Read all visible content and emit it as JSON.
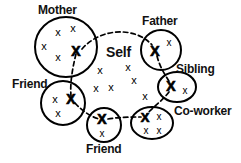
{
  "diagram": {
    "center_label": "Self",
    "stroke_color": "#000000",
    "background_color": "#ffffff",
    "mark_glyph": "x",
    "bold_mark_glyph": "X"
  },
  "labels": {
    "mother": "Mother",
    "father": "Father",
    "sibling": "Sibling",
    "coworker": "Co-worker",
    "friend_left": "Friend",
    "friend_bottom": "Friend",
    "self": "Self"
  },
  "groups": [
    {
      "id": "mother",
      "label": "Mother",
      "shape": "circle",
      "cx": 66,
      "cy": 47,
      "rx": 31,
      "ry": 30,
      "label_x": 38,
      "label_y": 4,
      "label_size": 12,
      "marks": [
        {
          "x": 58,
          "y": 32,
          "bold": false,
          "size": 11
        },
        {
          "x": 73,
          "y": 28,
          "bold": false,
          "size": 11
        },
        {
          "x": 44,
          "y": 46,
          "bold": false,
          "size": 11
        },
        {
          "x": 58,
          "y": 57,
          "bold": false,
          "size": 11
        },
        {
          "x": 76,
          "y": 51,
          "bold": true,
          "size": 14
        }
      ]
    },
    {
      "id": "father",
      "label": "Father",
      "shape": "circle",
      "cx": 161,
      "cy": 50,
      "rx": 20,
      "ry": 20,
      "label_x": 142,
      "label_y": 15,
      "label_size": 12,
      "marks": [
        {
          "x": 155,
          "y": 51,
          "bold": true,
          "size": 14
        },
        {
          "x": 169,
          "y": 42,
          "bold": false,
          "size": 10
        }
      ]
    },
    {
      "id": "sibling",
      "label": "Sibling",
      "shape": "ellipse",
      "cx": 177,
      "cy": 87,
      "rx": 19,
      "ry": 15,
      "label_x": 176,
      "label_y": 63,
      "label_size": 12,
      "marks": [
        {
          "x": 171,
          "y": 86,
          "bold": true,
          "size": 14
        },
        {
          "x": 185,
          "y": 90,
          "bold": false,
          "size": 10
        }
      ]
    },
    {
      "id": "coworker",
      "label": "Co-worker",
      "shape": "ellipse",
      "cx": 152,
      "cy": 123,
      "rx": 21,
      "ry": 16,
      "label_x": 174,
      "label_y": 105,
      "label_size": 12,
      "marks": [
        {
          "x": 145,
          "y": 117,
          "bold": true,
          "size": 13
        },
        {
          "x": 159,
          "y": 116,
          "bold": false,
          "size": 10
        },
        {
          "x": 146,
          "y": 130,
          "bold": false,
          "size": 10
        },
        {
          "x": 159,
          "y": 130,
          "bold": false,
          "size": 10
        }
      ]
    },
    {
      "id": "friend_bottom",
      "label": "Friend",
      "shape": "circle",
      "cx": 104,
      "cy": 125,
      "rx": 17,
      "ry": 17,
      "label_x": 86,
      "label_y": 143,
      "label_size": 12,
      "marks": [
        {
          "x": 102,
          "y": 119,
          "bold": true,
          "size": 14
        },
        {
          "x": 102,
          "y": 133,
          "bold": false,
          "size": 10
        }
      ]
    },
    {
      "id": "friend_left",
      "label": "Friend",
      "shape": "circle",
      "cx": 63,
      "cy": 103,
      "rx": 22,
      "ry": 22,
      "label_x": 12,
      "label_y": 78,
      "label_size": 12,
      "marks": [
        {
          "x": 55,
          "y": 99,
          "bold": false,
          "size": 11
        },
        {
          "x": 71,
          "y": 99,
          "bold": true,
          "size": 14
        },
        {
          "x": 58,
          "y": 113,
          "bold": false,
          "size": 11
        }
      ]
    }
  ],
  "self_cluster": {
    "label": "Self",
    "label_x": 106,
    "label_y": 45,
    "label_size": 14,
    "marks": [
      {
        "x": 100,
        "y": 70,
        "bold": false,
        "size": 11
      },
      {
        "x": 128,
        "y": 67,
        "bold": false,
        "size": 11
      },
      {
        "x": 134,
        "y": 80,
        "bold": false,
        "size": 11
      },
      {
        "x": 96,
        "y": 88,
        "bold": false,
        "size": 11
      },
      {
        "x": 111,
        "y": 87,
        "bold": false,
        "size": 11
      },
      {
        "x": 145,
        "y": 96,
        "bold": false,
        "size": 11
      }
    ]
  },
  "links": [
    {
      "id": "mother-father",
      "from": "mother",
      "to": "father",
      "style": "dashed-arc",
      "d": "M 82,49 C 100,28 135,26 152,45"
    },
    {
      "id": "mother-friend_left",
      "from": "mother",
      "to": "friend_left",
      "style": "dashed-line",
      "d": "M 76,54 C 72,70 70,84 71,96"
    },
    {
      "id": "father-sibling",
      "from": "father",
      "to": "sibling",
      "style": "dashed-line",
      "d": "M 157,56 C 160,68 166,76 170,83"
    },
    {
      "id": "sibling-coworker",
      "from": "sibling",
      "to": "coworker",
      "style": "dashed-line",
      "d": "M 169,92 C 162,101 152,108 147,114"
    },
    {
      "id": "friend_left-friend_bottom",
      "from": "friend_left",
      "to": "friend_bottom",
      "style": "dashed-line",
      "d": "M 75,103 C 83,112 92,117 99,119"
    },
    {
      "id": "friend_bottom-coworker",
      "from": "friend_bottom",
      "to": "coworker",
      "style": "dashed-line",
      "d": "M 108,119 C 120,117 132,117 141,117"
    }
  ]
}
